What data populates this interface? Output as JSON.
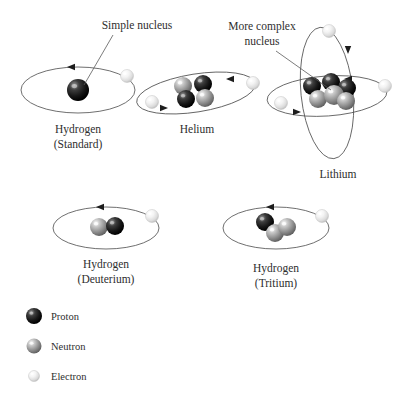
{
  "figure": {
    "background_color": "#ffffff"
  },
  "callouts": [
    {
      "id": "simple-nucleus",
      "lines": [
        "Simple nucleus"
      ],
      "text_x": 137,
      "text_y": 29,
      "anchor": "middle",
      "leader": {
        "x1": 113,
        "y1": 35,
        "x2": 84,
        "y2": 85
      }
    },
    {
      "id": "more-complex-nucleus",
      "lines": [
        "More complex",
        "nucleus"
      ],
      "text_x": 262,
      "text_y": 30,
      "anchor": "middle",
      "leader": {
        "x1": 276,
        "y1": 51,
        "x2": 331,
        "y2": 90
      }
    }
  ],
  "particles": {
    "proton": {
      "name": "Proton",
      "color": "#1b1b1b",
      "highlight": "#8f8f8f",
      "radius": 8
    },
    "neutron": {
      "name": "Neutron",
      "color": "#8c8c8c",
      "highlight": "#f2f2f2",
      "radius": 8
    },
    "electron": {
      "name": "Electron",
      "color": "#e4e4e4",
      "highlight": "#ffffff",
      "radius": 6
    }
  },
  "atoms": [
    {
      "id": "hydrogen-standard",
      "label_lines": [
        "Hydrogen",
        "(Standard)"
      ],
      "label_x": 78,
      "label_y": 133,
      "orbits": [
        {
          "cx": 78,
          "cy": 90,
          "rx": 57,
          "ry": 23,
          "rotate": 0,
          "arrows": [
            {
              "x": 72,
              "y": 67,
              "dir": "left"
            }
          ]
        }
      ],
      "nucleus": [
        {
          "type": "proton",
          "x": 78,
          "y": 90,
          "r": 11
        }
      ],
      "electrons": [
        {
          "x": 127,
          "y": 76,
          "r": 6.5
        }
      ]
    },
    {
      "id": "helium",
      "label_lines": [
        "Helium"
      ],
      "label_x": 197,
      "label_y": 133,
      "orbits": [
        {
          "cx": 196,
          "cy": 93,
          "rx": 60,
          "ry": 19,
          "rotate": -9,
          "arrows": [
            {
              "x": 231,
              "y": 79,
              "dir": "left"
            },
            {
              "x": 163,
              "y": 108,
              "dir": "right"
            }
          ]
        }
      ],
      "nucleus": [
        {
          "type": "neutron",
          "x": 183,
          "y": 86,
          "r": 9
        },
        {
          "type": "proton",
          "x": 203,
          "y": 84,
          "r": 9
        },
        {
          "type": "proton",
          "x": 186,
          "y": 99,
          "r": 9
        },
        {
          "type": "neutron",
          "x": 205,
          "y": 98,
          "r": 9
        }
      ],
      "electrons": [
        {
          "x": 253,
          "y": 83,
          "r": 6.5
        },
        {
          "x": 152,
          "y": 102,
          "r": 6.5
        }
      ]
    },
    {
      "id": "lithium",
      "label_lines": [
        "Lithium"
      ],
      "label_x": 338,
      "label_y": 178,
      "orbits": [
        {
          "cx": 327,
          "cy": 93,
          "rx": 26,
          "ry": 66,
          "rotate": -6,
          "arrows": [
            {
              "x": 348,
              "y": 49,
              "dir": "down"
            }
          ]
        },
        {
          "cx": 327,
          "cy": 96,
          "rx": 60,
          "ry": 20,
          "rotate": -4,
          "arrows": [
            {
              "x": 349,
              "y": 79,
              "dir": "left"
            },
            {
              "x": 296,
              "y": 112,
              "dir": "right"
            }
          ]
        }
      ],
      "nucleus": [
        {
          "type": "proton",
          "x": 312,
          "y": 86,
          "r": 9
        },
        {
          "type": "proton",
          "x": 331,
          "y": 82,
          "r": 9
        },
        {
          "type": "proton",
          "x": 347,
          "y": 88,
          "r": 9
        },
        {
          "type": "neutron",
          "x": 318,
          "y": 99,
          "r": 9
        },
        {
          "type": "neutron",
          "x": 334,
          "y": 95,
          "r": 10
        },
        {
          "type": "neutron",
          "x": 346,
          "y": 101,
          "r": 9
        }
      ],
      "electrons": [
        {
          "x": 329,
          "y": 31,
          "r": 6.5
        },
        {
          "x": 385,
          "y": 86,
          "r": 6.5
        },
        {
          "x": 281,
          "y": 103,
          "r": 6.5
        }
      ]
    },
    {
      "id": "hydrogen-deuterium",
      "label_lines": [
        "Hydrogen",
        "(Deuterium)"
      ],
      "label_x": 106,
      "label_y": 268,
      "orbits": [
        {
          "cx": 106,
          "cy": 228,
          "rx": 53,
          "ry": 21,
          "rotate": 0,
          "arrows": [
            {
              "x": 101,
              "y": 207,
              "dir": "left"
            }
          ]
        }
      ],
      "nucleus": [
        {
          "type": "neutron",
          "x": 99,
          "y": 227,
          "r": 9
        },
        {
          "type": "proton",
          "x": 115,
          "y": 226,
          "r": 9
        }
      ],
      "electrons": [
        {
          "x": 152,
          "y": 216,
          "r": 6.5
        }
      ]
    },
    {
      "id": "hydrogen-tritium",
      "label_lines": [
        "Hydrogen",
        "(Tritium)"
      ],
      "label_x": 276,
      "label_y": 272,
      "orbits": [
        {
          "cx": 276,
          "cy": 228,
          "rx": 53,
          "ry": 21,
          "rotate": 0,
          "arrows": [
            {
              "x": 271,
              "y": 207,
              "dir": "left"
            }
          ]
        }
      ],
      "nucleus": [
        {
          "type": "proton",
          "x": 265,
          "y": 222,
          "r": 9
        },
        {
          "type": "neutron",
          "x": 275,
          "y": 233,
          "r": 9
        },
        {
          "type": "neutron",
          "x": 287,
          "y": 227,
          "r": 9
        }
      ],
      "electrons": [
        {
          "x": 322,
          "y": 216,
          "r": 6.5
        }
      ]
    }
  ],
  "legend": {
    "items": [
      {
        "type": "proton",
        "label": "Proton",
        "x": 34,
        "y": 316,
        "r": 8,
        "label_x": 51,
        "label_y": 320
      },
      {
        "type": "neutron",
        "label": "Neutron",
        "x": 34,
        "y": 346,
        "r": 7.5,
        "label_x": 51,
        "label_y": 350
      },
      {
        "type": "electron",
        "label": "Electron",
        "x": 34,
        "y": 376,
        "r": 5.5,
        "label_x": 51,
        "label_y": 380
      }
    ]
  }
}
